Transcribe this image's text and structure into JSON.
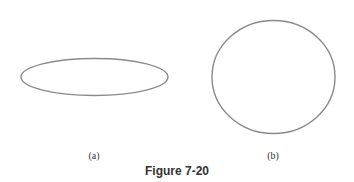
{
  "figure": {
    "caption": "Figure 7-20",
    "stroke_color": "#8a8a8a",
    "panels": [
      {
        "label": "(a)",
        "shape": "ellipse",
        "cx": 94.5,
        "cy": 77,
        "rx": 73.5,
        "ry": 18.5
      },
      {
        "label": "(b)",
        "shape": "circle",
        "cx": 273.5,
        "cy": 77,
        "rx": 61.5,
        "ry": 56.5
      }
    ]
  }
}
